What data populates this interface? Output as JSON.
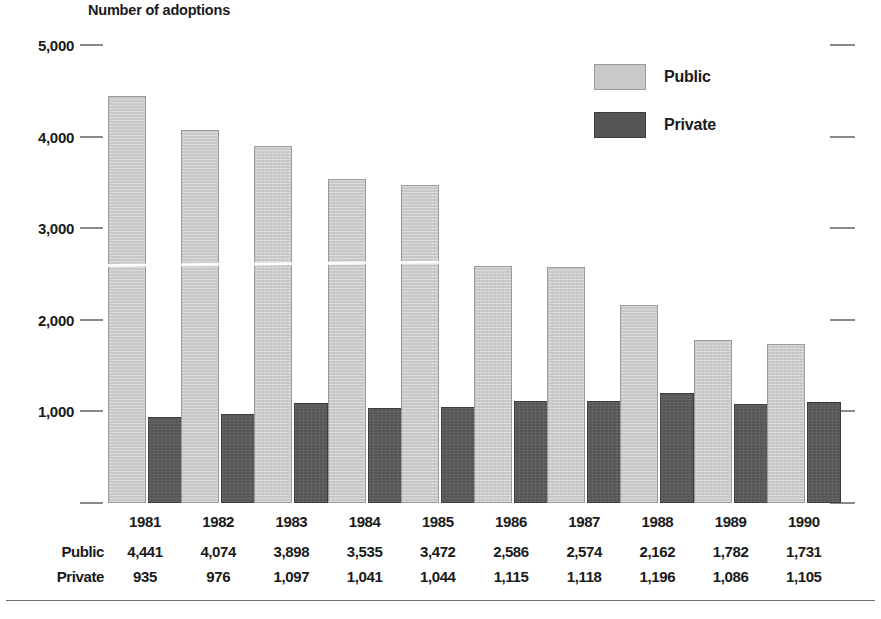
{
  "chart_data": {
    "type": "bar",
    "title": "",
    "ylabel": "Number of adoptions",
    "xlabel": "",
    "categories": [
      "1981",
      "1982",
      "1983",
      "1984",
      "1985",
      "1986",
      "1987",
      "1988",
      "1989",
      "1990"
    ],
    "series": [
      {
        "name": "Public",
        "color": "#c9c9c9",
        "values": [
          4441,
          4074,
          3898,
          3535,
          3472,
          2586,
          2574,
          2162,
          1782,
          1731
        ]
      },
      {
        "name": "Private",
        "color": "#565656",
        "values": [
          935,
          976,
          1097,
          1041,
          1044,
          1115,
          1118,
          1196,
          1086,
          1105
        ]
      }
    ],
    "ylim": [
      0,
      5000
    ],
    "ytick_values": [
      5000,
      4000,
      3000,
      2000,
      1000,
      0
    ],
    "ytick_labels": [
      "5,000",
      "4,000",
      "3,000",
      "2,000",
      "1,000",
      ""
    ],
    "grid": false,
    "legend_position": "top-right"
  },
  "axis": {
    "title": "Number of adoptions",
    "ticks": [
      {
        "label": "5,000",
        "value": 5000
      },
      {
        "label": "4,000",
        "value": 4000
      },
      {
        "label": "3,000",
        "value": 3000
      },
      {
        "label": "2,000",
        "value": 2000
      },
      {
        "label": "1,000",
        "value": 1000
      },
      {
        "label": "",
        "value": 0
      }
    ]
  },
  "legend": {
    "items": [
      {
        "label": "Public",
        "color": "#c9c9c9"
      },
      {
        "label": "Private",
        "color": "#565656"
      }
    ]
  },
  "table": {
    "years": [
      "1981",
      "1982",
      "1983",
      "1984",
      "1985",
      "1986",
      "1987",
      "1988",
      "1989",
      "1990"
    ],
    "rows": [
      {
        "header": "Public",
        "values": [
          "4,441",
          "4,074",
          "3,898",
          "3,535",
          "3,472",
          "2,586",
          "2,574",
          "2,162",
          "1,782",
          "1,731"
        ]
      },
      {
        "header": "Private",
        "values": [
          "935",
          "976",
          "1,097",
          "1,041",
          "1,044",
          "1,115",
          "1,118",
          "1,196",
          "1,086",
          "1,105"
        ]
      }
    ]
  }
}
